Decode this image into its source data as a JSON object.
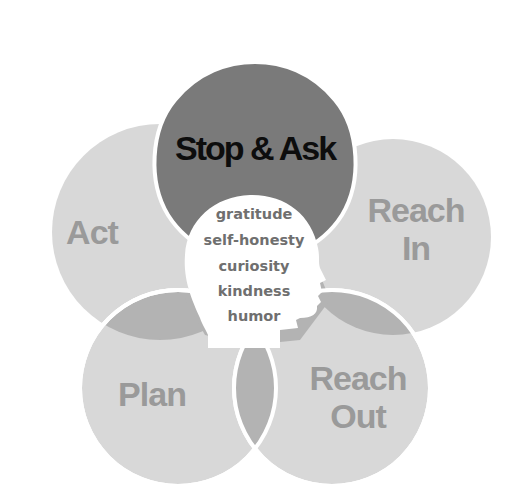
{
  "diagram": {
    "title": "Stop & Ask",
    "petals": [
      {
        "id": "act",
        "label": "Act"
      },
      {
        "id": "reach-in",
        "label_line1": "Reach",
        "label_line2": "In"
      },
      {
        "id": "plan",
        "label": "Plan"
      },
      {
        "id": "reach-out",
        "label_line1": "Reach",
        "label_line2": "Out"
      }
    ],
    "core_values": [
      "gratitude",
      "self-honesty",
      "curiosity",
      "kindness",
      "humor"
    ],
    "colors": {
      "top_petal": "#7a7a7a",
      "petal": "#d8d8d8",
      "overlap": "#b3b3b3",
      "separator": "#ffffff",
      "head": "#ffffff",
      "title_text": "#0d0d0d",
      "petal_text": "#9a9a9a",
      "core_text": "#6f6f6f"
    }
  }
}
